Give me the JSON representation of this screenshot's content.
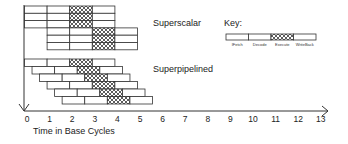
{
  "diagram": {
    "labels": {
      "superscalar": "Superscalar",
      "superpipelined": "Superpipelined",
      "key_title": "Key:",
      "x_axis_title": "Time in Base Cycles"
    },
    "key": {
      "stages": [
        "IFetch",
        "Decode",
        "Execute",
        "WriteBack"
      ],
      "hatched_stage": "Execute"
    },
    "x_axis": {
      "ticks": [
        "0",
        "1",
        "2",
        "3",
        "4",
        "5",
        "6",
        "7",
        "8",
        "9",
        "10",
        "11",
        "12",
        "13"
      ]
    },
    "superscalar": {
      "instructions": 6,
      "issue_width": 3,
      "stages_per_instruction": 4,
      "groups": [
        {
          "start_cycle": 0,
          "rows": 3
        },
        {
          "start_cycle": 1,
          "rows": 3
        }
      ]
    },
    "superpipelined": {
      "instructions": 6,
      "stages_per_instruction": 4,
      "start_offset_cycles_per_instruction": 0.333
    }
  }
}
